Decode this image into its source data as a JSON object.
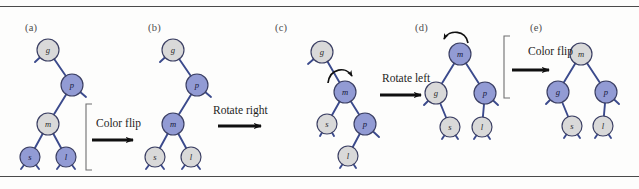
{
  "figure": {
    "background": "#fdfdfc",
    "rule_color": "#4a4a4a",
    "colors": {
      "red_node_fill": "#929fd4",
      "red_node_fill_hex": "#929bd4",
      "black_node_fill": "#d9d9d9",
      "node_stroke": "#3b3f63",
      "link_color": "#3b4a8c",
      "arrow_color": "#101010",
      "bracket_color": "#6f6f6f",
      "label_color": "#4d4d4d"
    },
    "panels": [
      {
        "id": "a",
        "label": "(a)",
        "label_x": 25,
        "label_y": 22,
        "nodes": [
          {
            "name": "g",
            "x": 48,
            "y": 50,
            "color": "black",
            "r": 11
          },
          {
            "name": "p",
            "x": 72,
            "y": 85,
            "color": "red",
            "r": 11
          },
          {
            "name": "m",
            "x": 48,
            "y": 124,
            "color": "black",
            "r": 11
          },
          {
            "name": "s",
            "x": 30,
            "y": 157,
            "color": "red",
            "r": 10
          },
          {
            "name": "l",
            "x": 66,
            "y": 157,
            "color": "red",
            "r": 10
          }
        ],
        "edges": [
          [
            "g",
            "p"
          ],
          [
            "p",
            "m"
          ],
          [
            "m",
            "s"
          ],
          [
            "m",
            "l"
          ]
        ],
        "stubs": [
          {
            "from": "g",
            "dx": -13,
            "dy": 12
          },
          {
            "from": "p",
            "dx": 14,
            "dy": 12
          },
          {
            "from": "s",
            "dx": -9,
            "dy": 12
          },
          {
            "from": "s",
            "dx": 9,
            "dy": 12
          },
          {
            "from": "l",
            "dx": -9,
            "dy": 12
          },
          {
            "from": "l",
            "dx": 9,
            "dy": 12
          }
        ],
        "curved_arrow": null
      },
      {
        "id": "b",
        "label": "(b)",
        "label_x": 148,
        "label_y": 22,
        "nodes": [
          {
            "name": "g",
            "x": 173,
            "y": 50,
            "color": "black",
            "r": 11
          },
          {
            "name": "p",
            "x": 197,
            "y": 85,
            "color": "red",
            "r": 11
          },
          {
            "name": "m",
            "x": 173,
            "y": 124,
            "color": "red",
            "r": 11
          },
          {
            "name": "s",
            "x": 155,
            "y": 157,
            "color": "black",
            "r": 10
          },
          {
            "name": "l",
            "x": 191,
            "y": 157,
            "color": "black",
            "r": 10
          }
        ],
        "edges": [
          [
            "g",
            "p"
          ],
          [
            "p",
            "m"
          ],
          [
            "m",
            "s"
          ],
          [
            "m",
            "l"
          ]
        ],
        "stubs": [
          {
            "from": "g",
            "dx": -13,
            "dy": 12
          },
          {
            "from": "p",
            "dx": 14,
            "dy": 12
          },
          {
            "from": "s",
            "dx": -9,
            "dy": 12
          },
          {
            "from": "s",
            "dx": 9,
            "dy": 12
          },
          {
            "from": "l",
            "dx": -9,
            "dy": 12
          },
          {
            "from": "l",
            "dx": 9,
            "dy": 12
          }
        ],
        "curved_arrow": null
      },
      {
        "id": "c",
        "label": "(c)",
        "label_x": 275,
        "label_y": 22,
        "nodes": [
          {
            "name": "g",
            "x": 322,
            "y": 52,
            "color": "black",
            "r": 11
          },
          {
            "name": "m",
            "x": 345,
            "y": 92,
            "color": "red",
            "r": 11
          },
          {
            "name": "s",
            "x": 327,
            "y": 124,
            "color": "black",
            "r": 10
          },
          {
            "name": "p",
            "x": 365,
            "y": 124,
            "color": "red",
            "r": 11
          },
          {
            "name": "l",
            "x": 348,
            "y": 156,
            "color": "black",
            "r": 10
          }
        ],
        "edges": [
          [
            "g",
            "m"
          ],
          [
            "m",
            "s"
          ],
          [
            "m",
            "p"
          ],
          [
            "p",
            "l"
          ]
        ],
        "stubs": [
          {
            "from": "g",
            "dx": -14,
            "dy": 12
          },
          {
            "from": "s",
            "dx": -7,
            "dy": 12
          },
          {
            "from": "s",
            "dx": 7,
            "dy": 12
          },
          {
            "from": "p",
            "dx": 14,
            "dy": 13
          },
          {
            "from": "l",
            "dx": -8,
            "dy": 12
          },
          {
            "from": "l",
            "dx": 8,
            "dy": 12
          }
        ],
        "curved_arrow": {
          "direction": "clockwise-right",
          "cx": 337,
          "cy": 74
        }
      },
      {
        "id": "d",
        "label": "(d)",
        "label_x": 415,
        "label_y": 22,
        "nodes": [
          {
            "name": "m",
            "x": 460,
            "y": 54,
            "color": "red",
            "r": 11
          },
          {
            "name": "g",
            "x": 436,
            "y": 93,
            "color": "black",
            "r": 11
          },
          {
            "name": "p",
            "x": 485,
            "y": 93,
            "color": "red",
            "r": 11
          },
          {
            "name": "s",
            "x": 450,
            "y": 127,
            "color": "black",
            "r": 10
          },
          {
            "name": "l",
            "x": 482,
            "y": 127,
            "color": "black",
            "r": 10
          }
        ],
        "edges": [
          [
            "m",
            "g"
          ],
          [
            "m",
            "p"
          ],
          [
            "g",
            "s"
          ],
          [
            "p",
            "l"
          ]
        ],
        "stubs": [
          {
            "from": "g",
            "dx": -12,
            "dy": 12
          },
          {
            "from": "p",
            "dx": 13,
            "dy": 12
          },
          {
            "from": "s",
            "dx": -8,
            "dy": 12
          },
          {
            "from": "s",
            "dx": 8,
            "dy": 12
          },
          {
            "from": "l",
            "dx": -8,
            "dy": 12
          },
          {
            "from": "l",
            "dx": 8,
            "dy": 12
          }
        ],
        "curved_arrow": {
          "direction": "counterclockwise-left",
          "cx": 455,
          "cy": 36
        }
      },
      {
        "id": "e",
        "label": "(e)",
        "label_x": 530,
        "label_y": 22,
        "nodes": [
          {
            "name": "m",
            "x": 581,
            "y": 54,
            "color": "black",
            "r": 11
          },
          {
            "name": "g",
            "x": 558,
            "y": 92,
            "color": "red",
            "r": 11
          },
          {
            "name": "p",
            "x": 606,
            "y": 92,
            "color": "red",
            "r": 11
          },
          {
            "name": "s",
            "x": 572,
            "y": 126,
            "color": "black",
            "r": 10
          },
          {
            "name": "l",
            "x": 603,
            "y": 126,
            "color": "black",
            "r": 10
          }
        ],
        "edges": [
          [
            "m",
            "g"
          ],
          [
            "m",
            "p"
          ],
          [
            "g",
            "s"
          ],
          [
            "p",
            "l"
          ]
        ],
        "stubs": [
          {
            "from": "g",
            "dx": -12,
            "dy": 12
          },
          {
            "from": "p",
            "dx": 13,
            "dy": 12
          },
          {
            "from": "s",
            "dx": -8,
            "dy": 12
          },
          {
            "from": "s",
            "dx": 8,
            "dy": 12
          },
          {
            "from": "l",
            "dx": -8,
            "dy": 12
          },
          {
            "from": "l",
            "dx": 8,
            "dy": 12
          }
        ],
        "curved_arrow": null
      }
    ],
    "transitions": [
      {
        "id": "t1",
        "label": "Color flip",
        "label_x": 96,
        "label_y": 117,
        "arrow": {
          "x1": 92,
          "y1": 140,
          "x2": 140,
          "y2": 140
        },
        "bracket": {
          "x": 86,
          "y": 104,
          "height": 66,
          "width": 6
        }
      },
      {
        "id": "t2",
        "label": "Rotate right",
        "label_x": 213,
        "label_y": 104,
        "arrow": {
          "x1": 218,
          "y1": 126,
          "x2": 268,
          "y2": 126
        },
        "bracket": null
      },
      {
        "id": "t3",
        "label": "Rotate left",
        "label_x": 382,
        "label_y": 72,
        "arrow": {
          "x1": 380,
          "y1": 95,
          "x2": 428,
          "y2": 95
        },
        "bracket": null
      },
      {
        "id": "t4",
        "label": "Color flip",
        "label_x": 528,
        "label_y": 45,
        "arrow": {
          "x1": 512,
          "y1": 70,
          "x2": 556,
          "y2": 70
        },
        "bracket": {
          "x": 504,
          "y": 36,
          "height": 62,
          "width": 6
        }
      }
    ]
  }
}
